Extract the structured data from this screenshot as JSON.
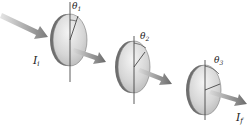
{
  "diagram": {
    "incident_intensity_label": "I",
    "incident_intensity_sub": "i",
    "final_intensity_label": "I",
    "final_intensity_sub": "f",
    "polarizers": [
      {
        "angle_symbol": "θ",
        "angle_sub": "1"
      },
      {
        "angle_symbol": "θ",
        "angle_sub": "2"
      },
      {
        "angle_symbol": "θ",
        "angle_sub": "3"
      }
    ],
    "colors": {
      "disc_face": "#d9d9d9",
      "disc_rim": "#6e6e6e",
      "arrow": "#8a8a8a",
      "axis_line": "#333333"
    }
  }
}
